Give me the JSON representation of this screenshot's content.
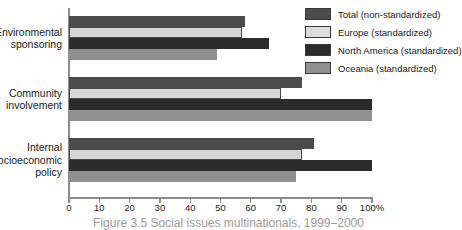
{
  "chart_data": {
    "type": "bar",
    "orientation": "horizontal",
    "title": "",
    "xlabel": "",
    "ylabel": "",
    "xlim": [
      0,
      100
    ],
    "grid": false,
    "legend_position": "top-right",
    "categories": [
      "Environmental\nsponsoring",
      "Community\ninvolvement",
      "Internal\nsocioeconomic\npolicy"
    ],
    "tick_labels": [
      "0",
      "10",
      "20",
      "30",
      "40",
      "50",
      "60",
      "70",
      "80",
      "90",
      "100%"
    ],
    "tick_values": [
      0,
      10,
      20,
      30,
      40,
      50,
      60,
      70,
      80,
      90,
      100
    ],
    "series": [
      {
        "name": "Total (non-standardized)",
        "color": "#4c4c4c",
        "values": [
          58,
          77,
          81
        ]
      },
      {
        "name": "Europe (standardized)",
        "color": "#d6d6d6",
        "values": [
          57,
          70,
          77
        ]
      },
      {
        "name": "North America (standardized)",
        "color": "#2b2b2b",
        "values": [
          66,
          100,
          100
        ]
      },
      {
        "name": "Oceania (standardized)",
        "color": "#909090",
        "values": [
          49,
          100,
          75
        ]
      }
    ]
  },
  "caption": "Figure 3.5 Social issues multinationals, 1999–2000"
}
